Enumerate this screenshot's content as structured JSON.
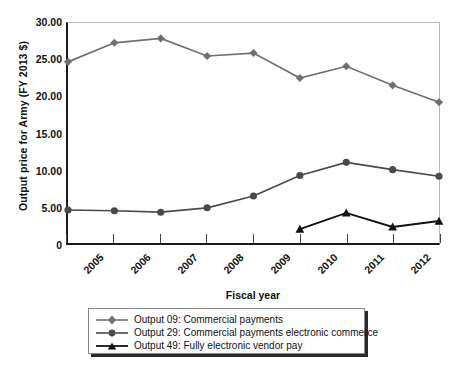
{
  "chart_data": {
    "type": "line",
    "title": "",
    "xlabel": "Fiscal year",
    "ylabel": "Output price for Army (FY 2013 $)",
    "x": [
      2005,
      2006,
      2007,
      2008,
      2009,
      2010,
      2011,
      2012,
      2013
    ],
    "categories": [
      "2005",
      "2006",
      "2007",
      "2008",
      "2009",
      "2010",
      "2011",
      "2012",
      "2013"
    ],
    "ylim": [
      0,
      30
    ],
    "yticks": [
      0,
      5,
      10,
      15,
      20,
      25,
      30
    ],
    "ytick_labels": [
      "0",
      "5.00",
      "10.00",
      "15.00",
      "20.00",
      "25.00",
      "30.00"
    ],
    "grid": false,
    "legend_position": "bottom",
    "series": [
      {
        "name": "Output 09: Commercial payments",
        "marker": "diamond",
        "color": "#6f6f6f",
        "values": [
          24.7,
          27.3,
          27.9,
          25.5,
          25.9,
          22.5,
          24.1,
          21.5,
          19.2
        ]
      },
      {
        "name": "Output 29: Commercial payments electronic commerce",
        "marker": "circle",
        "color": "#4a4a4a",
        "values": [
          4.5,
          4.4,
          4.2,
          4.8,
          6.4,
          9.2,
          11.0,
          10.0,
          9.1
        ]
      },
      {
        "name": "Output 49: Fully electronic vendor pay",
        "marker": "triangle",
        "color": "#111111",
        "values": [
          null,
          null,
          null,
          null,
          null,
          1.9,
          4.1,
          2.2,
          3.0
        ]
      }
    ]
  }
}
